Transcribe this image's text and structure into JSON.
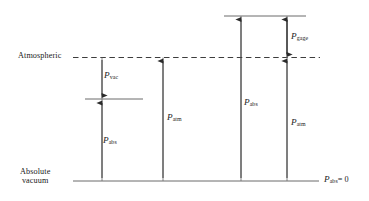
{
  "figure": {
    "type": "pressure-level-diagram",
    "width": 369,
    "height": 201,
    "line_color": "#4a4a4a",
    "text_color": "#1a1a1a"
  },
  "reference_lines": [
    {
      "id": "atmospheric",
      "label": "Atmospheric",
      "style": "dashed",
      "y": 57,
      "x_start": 73,
      "x_end": 320
    },
    {
      "id": "absolute-vacuum",
      "label_line1": "Absolute",
      "label_line2": "vacuum",
      "style": "solid",
      "y": 181,
      "x_start": 73,
      "x_end": 319,
      "right_label": "P",
      "right_label_sub": "abs",
      "right_label_value": "= 0"
    },
    {
      "id": "upper-level",
      "style": "solid",
      "y": 16,
      "x_start": 224,
      "x_end": 306
    },
    {
      "id": "sub-atmospheric-level",
      "style": "solid",
      "y": 99,
      "x_start": 85,
      "x_end": 143
    }
  ],
  "columns": [
    {
      "id": "column-vacuum",
      "x": 102,
      "measures": [
        {
          "id": "p-vac",
          "symbol": "P",
          "sub": "vac",
          "label_x": 104,
          "label_y": 72
        },
        {
          "id": "p-abs-1",
          "symbol": "P",
          "sub": "abs",
          "label_x": 103,
          "label_y": 137
        }
      ]
    },
    {
      "id": "column-atmospheric",
      "x": 163,
      "measures": [
        {
          "id": "p-atm-1",
          "symbol": "P",
          "sub": "atm",
          "label_x": 167,
          "label_y": 114
        }
      ]
    },
    {
      "id": "column-absolute-high",
      "x": 241,
      "measures": [
        {
          "id": "p-abs-2",
          "symbol": "P",
          "sub": "abs",
          "label_x": 244,
          "label_y": 99
        }
      ]
    },
    {
      "id": "column-gage",
      "x": 287,
      "measures": [
        {
          "id": "p-gage",
          "symbol": "P",
          "sub": "gage",
          "label_x": 291,
          "label_y": 33
        },
        {
          "id": "p-atm-2",
          "symbol": "P",
          "sub": "atm",
          "label_x": 291,
          "label_y": 119
        }
      ]
    }
  ],
  "labels": {
    "atmospheric": "Atmospheric",
    "absolute": "Absolute",
    "vacuum": "vacuum",
    "p_symbol": "P",
    "sub_vac": "vac",
    "sub_abs": "abs",
    "sub_atm": "atm",
    "sub_gage": "gage",
    "equals_zero": "= 0"
  }
}
